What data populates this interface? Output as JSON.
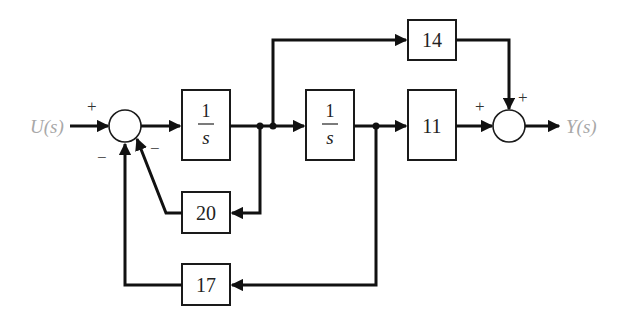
{
  "diagram": {
    "type": "block-diagram",
    "input": {
      "label": "U(s)",
      "color": "#a8a8a8"
    },
    "output": {
      "label": "Y(s)",
      "color": "#a8a8a8"
    },
    "blocks": [
      {
        "id": "integrator1",
        "numerator": "1",
        "denominator": "s"
      },
      {
        "id": "integrator2",
        "numerator": "1",
        "denominator": "s"
      },
      {
        "id": "gain_11",
        "label": "11"
      },
      {
        "id": "gain_14",
        "label": "14"
      },
      {
        "id": "gain_20",
        "label": "20"
      },
      {
        "id": "gain_17",
        "label": "17"
      }
    ],
    "summing_junctions": [
      {
        "id": "sum1",
        "signs": {
          "input": "+",
          "feedback_17": "−",
          "feedback_20": "−"
        }
      },
      {
        "id": "sum2",
        "signs": {
          "from_11": "+",
          "from_14": "+"
        }
      }
    ],
    "connections": [
      "U(s) → sum1 (+)",
      "sum1 → 1/s (integrator1)",
      "integrator1 → integrator2",
      "integrator1 output → 20 → sum1 (−)",
      "integrator1 output → 14 → sum2 (+)",
      "integrator2 → 11 → sum2 (+)",
      "integrator2 output → 17 → sum1 (−)",
      "sum2 → Y(s)"
    ]
  }
}
